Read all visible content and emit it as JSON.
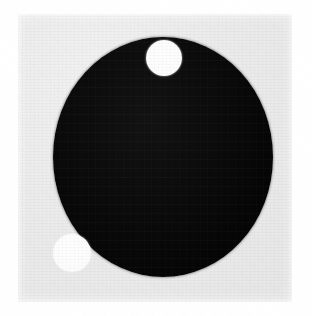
{
  "image": {
    "kind": "grayscale-photograph",
    "width": 312,
    "height": 316,
    "page_background_color": "#ffffff",
    "caption": ""
  },
  "plate": {
    "label": "light gray square plate",
    "color": "#ececed",
    "x": 18,
    "y": 14,
    "width": 274,
    "height": 288
  },
  "dark_disc": {
    "label": "large black disc",
    "color": "#080808",
    "center_x": 163,
    "center_y": 157,
    "width": 220,
    "height": 240
  },
  "spots": [
    {
      "label": "white circular spot upper",
      "color": "#ffffff",
      "center_x": 164,
      "center_y": 58,
      "diameter": 36
    },
    {
      "label": "white circular spot lower left",
      "color": "#ffffff",
      "center_x": 72,
      "center_y": 253,
      "diameter": 38
    }
  ]
}
